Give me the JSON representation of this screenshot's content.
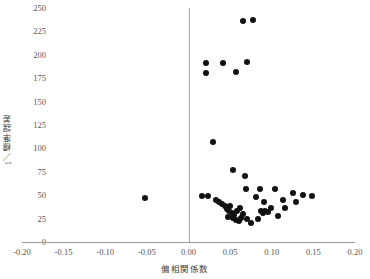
{
  "chart_data": {
    "type": "scatter",
    "title": "",
    "xlabel": "偏相関係数",
    "ylabel": "1／標準誤差",
    "xlim": [
      -0.2,
      0.2
    ],
    "ylim": [
      0,
      250
    ],
    "xticks": [
      -0.2,
      -0.15,
      -0.1,
      -0.05,
      0.0,
      0.05,
      0.1,
      0.15,
      0.2
    ],
    "xticklabels": [
      "-0.20",
      "-0.15",
      "-0.10",
      "-0.05",
      "0.00",
      "0.05",
      "0.10",
      "0.15",
      "0.20"
    ],
    "yticks": [
      0,
      25,
      50,
      75,
      100,
      125,
      150,
      175,
      200,
      225,
      250
    ],
    "yticklabels": [
      "0",
      "25",
      "50",
      "75",
      "100",
      "125",
      "150",
      "175",
      "200",
      "225",
      "250"
    ],
    "grid": false,
    "legend": null,
    "marker": {
      "shape": "circle",
      "color": "#111111",
      "size": 6
    },
    "reference_line": {
      "orientation": "vertical",
      "x": 0.0,
      "color": "#a8a8a8"
    },
    "points": [
      {
        "x": 0.065,
        "y": 236
      },
      {
        "x": 0.077,
        "y": 237
      },
      {
        "x": 0.021,
        "y": 191
      },
      {
        "x": 0.021,
        "y": 181
      },
      {
        "x": 0.042,
        "y": 191
      },
      {
        "x": 0.057,
        "y": 182
      },
      {
        "x": 0.07,
        "y": 192
      },
      {
        "x": 0.029,
        "y": 107
      },
      {
        "x": 0.054,
        "y": 77
      },
      {
        "x": 0.068,
        "y": 70
      },
      {
        "x": 0.069,
        "y": 57
      },
      {
        "x": 0.086,
        "y": 57
      },
      {
        "x": 0.104,
        "y": 57
      },
      {
        "x": 0.125,
        "y": 52
      },
      {
        "x": 0.138,
        "y": 50
      },
      {
        "x": 0.148,
        "y": 49
      },
      {
        "x": 0.113,
        "y": 45
      },
      {
        "x": 0.129,
        "y": 43
      },
      {
        "x": 0.099,
        "y": 36
      },
      {
        "x": 0.116,
        "y": 36
      },
      {
        "x": 0.087,
        "y": 33
      },
      {
        "x": 0.092,
        "y": 33
      },
      {
        "x": 0.096,
        "y": 32
      },
      {
        "x": 0.09,
        "y": 31
      },
      {
        "x": 0.107,
        "y": 28
      },
      {
        "x": 0.083,
        "y": 25
      },
      {
        "x": 0.091,
        "y": 43
      },
      {
        "x": 0.081,
        "y": 48
      },
      {
        "x": 0.016,
        "y": 49
      },
      {
        "x": 0.024,
        "y": 49
      },
      {
        "x": 0.033,
        "y": 45
      },
      {
        "x": 0.037,
        "y": 43
      },
      {
        "x": 0.04,
        "y": 41
      },
      {
        "x": 0.044,
        "y": 38
      },
      {
        "x": 0.046,
        "y": 35
      },
      {
        "x": 0.049,
        "y": 33
      },
      {
        "x": 0.052,
        "y": 31
      },
      {
        "x": 0.055,
        "y": 29
      },
      {
        "x": 0.048,
        "y": 27
      },
      {
        "x": 0.053,
        "y": 26
      },
      {
        "x": 0.057,
        "y": 24
      },
      {
        "x": 0.061,
        "y": 22
      },
      {
        "x": 0.063,
        "y": 26
      },
      {
        "x": 0.058,
        "y": 33
      },
      {
        "x": 0.05,
        "y": 38
      },
      {
        "x": 0.062,
        "y": 36
      },
      {
        "x": 0.066,
        "y": 30
      },
      {
        "x": 0.07,
        "y": 25
      },
      {
        "x": 0.075,
        "y": 20
      },
      {
        "x": -0.052,
        "y": 47
      }
    ]
  }
}
